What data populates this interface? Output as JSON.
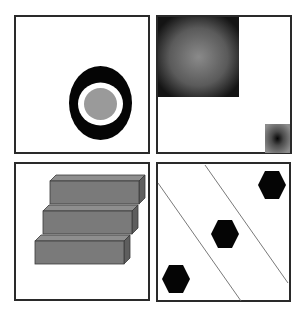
{
  "panels": [
    {
      "id": "concentric-ring",
      "shape": "ring",
      "outer_color": "#050505",
      "gap_color": "#ffffff",
      "inner_color": "#9a9a9a"
    },
    {
      "id": "gradient-squares",
      "shape": "squares",
      "large_color_center": "#8a8a8a",
      "large_color_edge": "#141414",
      "small_color_center": "#050505",
      "small_color_edge": "#8c8c8c"
    },
    {
      "id": "staircase",
      "shape": "steps",
      "step_count": 3,
      "front_color": "#7a7a7a",
      "top_color": "#8e8e8e",
      "side_color": "#5e5e5e"
    },
    {
      "id": "hexagons-lines",
      "shape": "hexagons",
      "hexagon_count": 3,
      "hex_color": "#050505",
      "line_color": "#6a6a6a"
    }
  ],
  "colors": {
    "border": "#2a2a2a",
    "background": "#ffffff"
  }
}
